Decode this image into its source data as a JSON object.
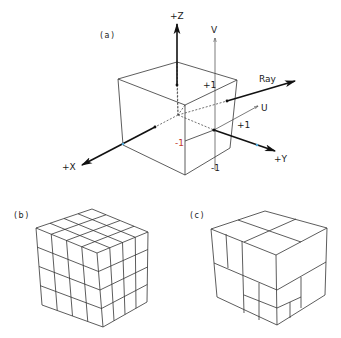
{
  "panels": {
    "a": {
      "label": "(a)",
      "label_pos": [
        100,
        38
      ],
      "cube": {
        "back_top": [
          177,
          62
        ],
        "left_top": [
          118,
          79
        ],
        "right_top": [
          237,
          80
        ],
        "front_top": [
          185,
          105
        ],
        "left_bottom": [
          123,
          145
        ],
        "front_bottom": [
          185,
          175
        ],
        "right_bottom": [
          230,
          148
        ],
        "center": [
          178,
          115
        ]
      },
      "axes": [
        {
          "name": "+Z",
          "from": [
            177,
            85
          ],
          "to": [
            177,
            24
          ],
          "style": "bold",
          "label_pos": [
            170,
            19
          ]
        },
        {
          "name": "+X",
          "from": [
            155,
            127
          ],
          "to": [
            82,
            165
          ],
          "style": "bold",
          "label_pos": [
            62,
            170
          ]
        },
        {
          "name": "+Y",
          "from": [
            214,
            130
          ],
          "to": [
            275,
            151
          ],
          "style": "bold",
          "label_pos": [
            274,
            162
          ]
        },
        {
          "name": "V",
          "from": [
            215,
            170
          ],
          "to": [
            215,
            38
          ],
          "style": "thin",
          "label_pos": [
            211,
            33
          ]
        },
        {
          "name": "U",
          "from": [
            214,
            130
          ],
          "to": [
            258,
            106
          ],
          "style": "thin",
          "label_pos": [
            261,
            111
          ]
        },
        {
          "name": "Ray",
          "from": [
            227,
            101
          ],
          "to": [
            295,
            81
          ],
          "style": "bold",
          "label_pos": [
            259,
            82
          ]
        }
      ],
      "tick_labels": [
        {
          "text": "+1",
          "pos": [
            203,
            88
          ]
        },
        {
          "text": "+1",
          "pos": [
            237,
            128
          ]
        },
        {
          "text": "-1",
          "pos": [
            175,
            146
          ]
        },
        {
          "text": "-1",
          "pos": [
            211,
            171
          ]
        }
      ],
      "accent_colors": {
        "axis_marker": "#4fa8d8",
        "minus_one_label": "#c0392b"
      }
    },
    "b": {
      "label": "(b)",
      "label_pos": [
        14,
        218
      ],
      "subdivision": 4,
      "cube": {
        "back_top": [
          92,
          209
        ],
        "left_top": [
          36,
          228
        ],
        "right_top": [
          148,
          232
        ],
        "front_top": [
          97,
          253
        ],
        "left_bottom": [
          42,
          305
        ],
        "front_bottom": [
          103,
          327
        ],
        "right_bottom": [
          147,
          302
        ]
      }
    },
    "c": {
      "label": "(c)",
      "label_pos": [
        190,
        218
      ],
      "cube": {
        "back_top": [
          265,
          211
        ],
        "left_top": [
          211,
          229
        ],
        "right_top": [
          327,
          228
        ],
        "front_top": [
          276,
          255
        ],
        "left_bottom": [
          217,
          297
        ],
        "front_bottom": [
          277,
          325
        ],
        "right_bottom": [
          325,
          295
        ]
      },
      "inner_lines": [
        [
          [
            238,
            220
          ],
          [
            301,
            242
          ]
        ],
        [
          [
            244,
            242
          ],
          [
            296,
            219
          ]
        ],
        [
          [
            214,
            263
          ],
          [
            277,
            290
          ]
        ],
        [
          [
            277,
            290
          ],
          [
            326,
            262
          ]
        ],
        [
          [
            226,
            234
          ],
          [
            228,
            268
          ]
        ],
        [
          [
            242,
            241
          ],
          [
            244,
            313
          ]
        ],
        [
          [
            244,
            295
          ],
          [
            277,
            308
          ]
        ],
        [
          [
            259,
            283
          ],
          [
            259,
            320
          ]
        ],
        [
          [
            301,
            277
          ],
          [
            301,
            308
          ]
        ],
        [
          [
            277,
            308
          ],
          [
            301,
            297
          ]
        ],
        [
          [
            290,
            302
          ],
          [
            290,
            318
          ]
        ]
      ]
    }
  }
}
